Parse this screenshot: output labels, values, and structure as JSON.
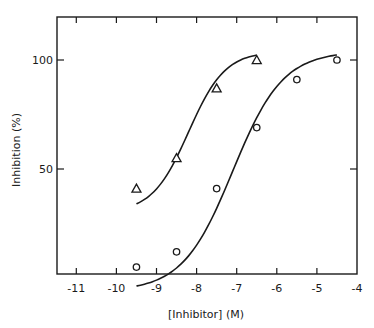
{
  "chart_data": {
    "type": "scatter",
    "title": "",
    "xlabel": "[Inhibitor] (M)",
    "ylabel": "Inhibition (%)",
    "xlim": [
      -11.5,
      -4
    ],
    "ylim": [
      -2,
      120
    ],
    "xticks": [
      -11,
      -10,
      -9,
      -8,
      -7,
      -6,
      -5,
      -4
    ],
    "xtick_labels": [
      "-11",
      "-10",
      "-9",
      "-8",
      "-7",
      "-6",
      "-5",
      "-4"
    ],
    "yticks": [
      50,
      100
    ],
    "ytick_labels": [
      "50",
      "100"
    ],
    "grid": false,
    "legend": null,
    "series": [
      {
        "name": "triangles",
        "marker": "triangle-open",
        "x": [
          -9.5,
          -8.5,
          -7.5,
          -6.5
        ],
        "y": [
          41,
          55,
          87,
          100
        ],
        "fit_curve": true
      },
      {
        "name": "circles",
        "marker": "circle-open",
        "x": [
          -9.5,
          -8.5,
          -7.5,
          -6.5,
          -5.5,
          -4.5
        ],
        "y": [
          5,
          12,
          41,
          69,
          91,
          100
        ],
        "fit_curve": true
      }
    ],
    "colors": {
      "ink": "#1a1a1a",
      "background": "#ffffff"
    }
  }
}
